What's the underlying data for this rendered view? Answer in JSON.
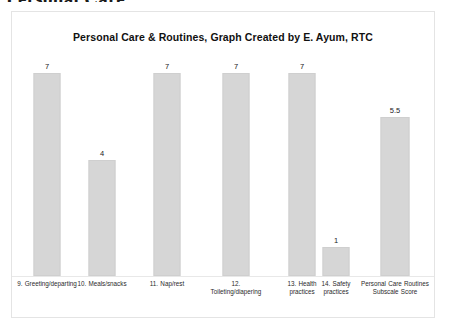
{
  "document": {
    "heading": "Personal Care"
  },
  "chart": {
    "title": "Personal Care & Routines, Graph Created by E. Ayum, RTC",
    "bar_color": "#d6d6d6",
    "border_color": "#e4e4e4",
    "background": "#ffffff"
  },
  "chart_data": {
    "type": "bar",
    "title": "Personal Care & Routines, Graph Created by E. Ayum, RTC",
    "xlabel": "",
    "ylabel": "",
    "ylim": [
      0,
      7
    ],
    "grid": false,
    "legend": "none",
    "categories": [
      "9. Greeting/departing",
      "10. Meals/snacks",
      "11. Nap/rest",
      "12. Toileting/diapering",
      "13. Health practices",
      "14. Safety practices",
      "Personal Care Routines Subscale Score"
    ],
    "values": [
      7,
      4,
      7,
      7,
      7,
      1,
      5.5
    ],
    "value_labels": [
      "7",
      "4",
      "7",
      "7",
      "7",
      "1",
      "5.5"
    ]
  }
}
